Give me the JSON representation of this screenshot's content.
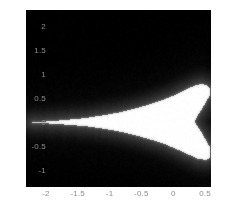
{
  "figure": {
    "width": 226,
    "height": 209,
    "background": "#ffffff",
    "plot_background": "#000000",
    "tick_color": "#8c8c8c"
  },
  "chart_data": {
    "type": "heatmap",
    "title": "",
    "xlabel": "",
    "ylabel": "",
    "grid": false,
    "legend": "none",
    "colormap": "gray",
    "colormap_low": "#000000",
    "colormap_high": "#ffffff",
    "xlim": [
      -2.3125,
      0.59375
    ],
    "ylim": [
      2.34375,
      -1.34375
    ],
    "y_axis_inverted": true,
    "xticks": [
      -2,
      -1.5,
      -1,
      -0.5,
      0,
      0.5
    ],
    "xticklabels": [
      "-2",
      "-1.5",
      "-1",
      "-0.5",
      "0",
      "0.5"
    ],
    "yticks": [
      -1,
      -0.5,
      0,
      0.5,
      1,
      1.5,
      2
    ],
    "yticklabels": [
      "-1",
      "-0.5",
      "0",
      "0.5",
      "1",
      "1.5",
      "2"
    ],
    "region_outline": [
      [
        -2.3,
        0.0
      ],
      [
        -1.95,
        -0.02
      ],
      [
        -1.6,
        -0.05
      ],
      [
        -1.3,
        -0.09
      ],
      [
        -1.05,
        -0.14
      ],
      [
        -0.8,
        -0.2
      ],
      [
        -0.55,
        -0.28
      ],
      [
        -0.32,
        -0.37
      ],
      [
        -0.12,
        -0.46
      ],
      [
        0.05,
        -0.55
      ],
      [
        0.18,
        -0.63
      ],
      [
        0.29,
        -0.7
      ],
      [
        0.38,
        -0.75
      ],
      [
        0.46,
        -0.77
      ],
      [
        0.54,
        -0.77
      ],
      [
        0.58,
        -0.74
      ],
      [
        0.58,
        -0.52
      ],
      [
        0.52,
        -0.38
      ],
      [
        0.45,
        -0.22
      ],
      [
        0.38,
        -0.08
      ],
      [
        0.34,
        0.02
      ],
      [
        0.38,
        0.14
      ],
      [
        0.45,
        0.28
      ],
      [
        0.52,
        0.44
      ],
      [
        0.58,
        0.58
      ],
      [
        0.58,
        0.72
      ],
      [
        0.52,
        0.78
      ],
      [
        0.44,
        0.8
      ],
      [
        0.36,
        0.78
      ],
      [
        0.27,
        0.73
      ],
      [
        0.16,
        0.66
      ],
      [
        0.02,
        0.57
      ],
      [
        -0.15,
        0.48
      ],
      [
        -0.36,
        0.38
      ],
      [
        -0.6,
        0.29
      ],
      [
        -0.85,
        0.21
      ],
      [
        -1.1,
        0.15
      ],
      [
        -1.4,
        0.09
      ],
      [
        -1.7,
        0.05
      ],
      [
        -2.0,
        0.02
      ],
      [
        -2.3,
        0.0
      ]
    ],
    "halo": {
      "description": "Soft dark-gray gradient falloff surrounding the bright region, strongest just outside the white boundary and fading to black within roughly 0.35 units.",
      "falloff_units": 0.35,
      "peak_gray": "#3a3a3a"
    }
  }
}
